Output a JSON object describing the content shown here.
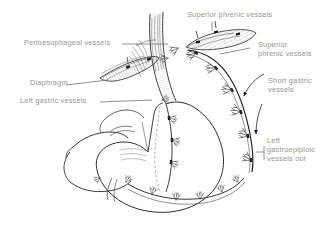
{
  "figure": {
    "background_color": "#ffffff",
    "ink_color": "#2b2b2b",
    "label_color": "#9c958e",
    "width": 330,
    "height": 236
  },
  "labels": {
    "perioesophageal_vessels": "Perioesophageal vessels",
    "diaphragm": "Diaphragm",
    "left_gastric_vessels": "Left gastric vessels",
    "superior_phrenic_vessels_top": "Superior phrenic vessels",
    "superior_phrenic_vessels_right": "Superior\nphrenic vessels",
    "short_gastric_vessels": "Short gastric\nvessels",
    "left_gastroepiploic_vessels_out": "Left\ngastroepiploic\nvessels out"
  },
  "structures": {
    "oesophagus": "oesophagus",
    "stomach_body": "stomach-body",
    "greater_curvature": "greater-curvature",
    "lesser_curvature": "lesser-curvature",
    "gastroepiploic_arcade": "gastroepiploic-arcade",
    "diaphragm_band": "diaphragm-band",
    "phrenic_band": "superior-phrenic-band",
    "ligature_clips_count": 14,
    "vessel_branch_count": 22
  }
}
